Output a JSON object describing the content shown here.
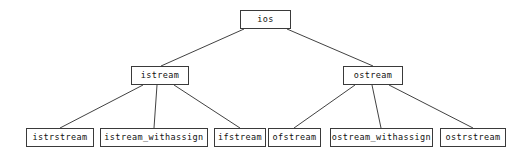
{
  "diagram": {
    "type": "tree",
    "background_color": "#ffffff",
    "box_border_color": "#3a3a3a",
    "edge_color": "#2b2b2b",
    "text_color": "#111111",
    "nodes": [
      {
        "id": "ios",
        "label": "ios",
        "level": 0,
        "x": 240,
        "y": 10,
        "w": 51,
        "h": 19,
        "font_size": 8.5
      },
      {
        "id": "istream",
        "label": "istream",
        "level": 1,
        "x": 131,
        "y": 66,
        "w": 58,
        "h": 19,
        "font_size": 8.5
      },
      {
        "id": "ostream",
        "label": "ostream",
        "level": 1,
        "x": 343,
        "y": 66,
        "w": 60,
        "h": 19,
        "font_size": 8.5
      },
      {
        "id": "istrstream",
        "label": "istrstream",
        "level": 2,
        "x": 26,
        "y": 128,
        "w": 68,
        "h": 19,
        "font_size": 8.5
      },
      {
        "id": "istream_withassign",
        "label": "istream_withassign",
        "level": 2,
        "x": 100,
        "y": 128,
        "w": 108,
        "h": 19,
        "font_size": 8.5
      },
      {
        "id": "ifstream",
        "label": "ifstream",
        "level": 2,
        "x": 214,
        "y": 128,
        "w": 52,
        "h": 19,
        "font_size": 8.5
      },
      {
        "id": "ofstream",
        "label": "ofstream",
        "level": 2,
        "x": 268,
        "y": 128,
        "w": 53,
        "h": 19,
        "font_size": 8.5
      },
      {
        "id": "ostream_withassign",
        "label": "ostream_withassign",
        "level": 2,
        "x": 330,
        "y": 128,
        "w": 103,
        "h": 19,
        "font_size": 8.5
      },
      {
        "id": "ostrstream",
        "label": "ostrstream",
        "level": 2,
        "x": 440,
        "y": 128,
        "w": 66,
        "h": 19,
        "font_size": 8.5
      }
    ],
    "edges": [
      {
        "from": "ios",
        "to": "istream",
        "x1": 244,
        "y1": 29,
        "x2": 161,
        "y2": 66
      },
      {
        "from": "ios",
        "to": "ostream",
        "x1": 287,
        "y1": 29,
        "x2": 373,
        "y2": 66
      },
      {
        "from": "istream",
        "to": "istrstream",
        "x1": 143,
        "y1": 85,
        "x2": 60,
        "y2": 128
      },
      {
        "from": "istream",
        "to": "istream_withassign",
        "x1": 157,
        "y1": 85,
        "x2": 154,
        "y2": 128
      },
      {
        "from": "istream",
        "to": "ifstream",
        "x1": 174,
        "y1": 85,
        "x2": 240,
        "y2": 128
      },
      {
        "from": "ostream",
        "to": "ofstream",
        "x1": 355,
        "y1": 85,
        "x2": 294,
        "y2": 128
      },
      {
        "from": "ostream",
        "to": "ostream_withassign",
        "x1": 372,
        "y1": 85,
        "x2": 381,
        "y2": 128
      },
      {
        "from": "ostream",
        "to": "ostrstream",
        "x1": 389,
        "y1": 85,
        "x2": 473,
        "y2": 128
      }
    ]
  }
}
